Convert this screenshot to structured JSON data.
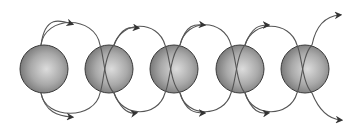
{
  "diagram": {
    "sphere_count": 5,
    "spheres": [
      {
        "cx": 44,
        "cy": 69
      },
      {
        "cx": 109,
        "cy": 69
      },
      {
        "cx": 174,
        "cy": 69
      },
      {
        "cx": 240,
        "cy": 69
      },
      {
        "cx": 305,
        "cy": 69
      }
    ],
    "sphere_radius": 24,
    "colors": {
      "sphere_light": "#d8d8d8",
      "sphere_mid": "#a8a8a8",
      "sphere_dark": "#6a6a6a",
      "outline": "#3a3a3a",
      "arrow": "#555555"
    }
  }
}
